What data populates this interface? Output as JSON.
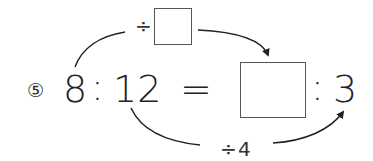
{
  "problem": {
    "number_label": "⑤",
    "left_ratio": {
      "a": "8",
      "separator": ":",
      "b": "12"
    },
    "equals": "=",
    "right_ratio": {
      "a_blank": "",
      "separator": ":",
      "b": "3"
    },
    "top_operation": {
      "operator": "÷",
      "operand_blank": ""
    },
    "bottom_operation": {
      "operator": "÷",
      "operand": "4"
    }
  },
  "colors": {
    "ink": "#222222",
    "box_border": "#555555",
    "background": "#ffffff"
  }
}
